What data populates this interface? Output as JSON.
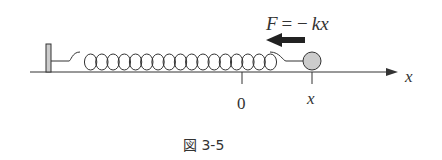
{
  "figure": {
    "force_label": "F = − kx",
    "force_label_parts": {
      "F": "F",
      "eq": "= −",
      "kx": "kx"
    },
    "axis_label": "x",
    "origin_label": "0",
    "position_label": "x",
    "caption": "図 3-5",
    "colors": {
      "ink": "#333333",
      "fill": "#cccccc"
    }
  }
}
